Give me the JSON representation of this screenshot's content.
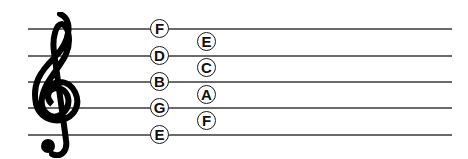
{
  "staff": {
    "clef": "treble-clef",
    "line_color": "#6a6a6a",
    "line_notes": [
      "F",
      "D",
      "B",
      "G",
      "E"
    ],
    "space_notes": [
      "E",
      "C",
      "A",
      "F"
    ]
  }
}
